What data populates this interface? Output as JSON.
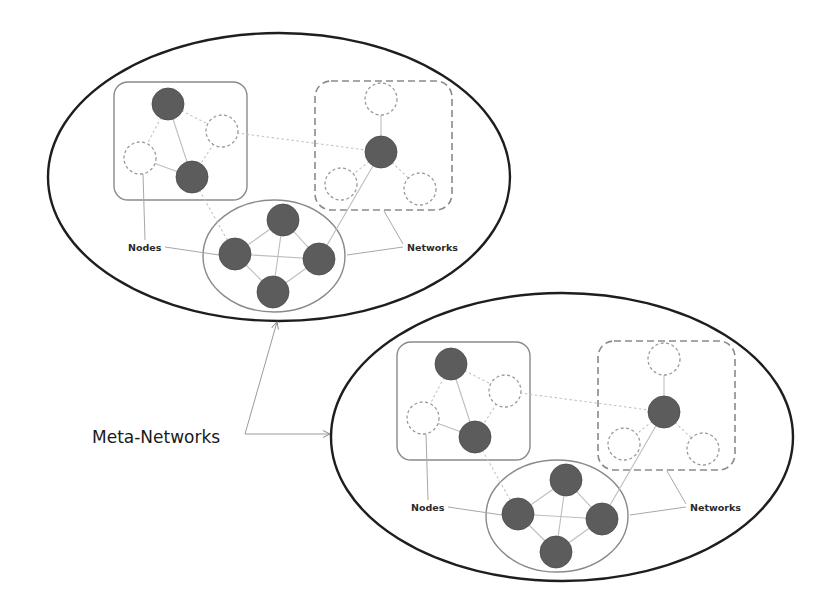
{
  "diagram": {
    "title_label": "Meta-Networks",
    "node_label": "Nodes",
    "network_label": "Networks",
    "colors": {
      "outer_stroke": "#1e1e1e",
      "filled_node": "#5c5c5c",
      "box_stroke": "#8a8a8a",
      "edge": "#bdbdbd"
    },
    "meta_networks": [
      {
        "id": "upper",
        "offset": [
          0,
          0
        ],
        "nodes_label": "Nodes",
        "networks_label": "Networks"
      },
      {
        "id": "lower",
        "offset": [
          283,
          260
        ],
        "nodes_label": "Nodes",
        "networks_label": "Networks"
      }
    ],
    "template": {
      "outer_ellipse": {
        "cx": 279,
        "cy": 177,
        "rx": 231,
        "ry": 144
      },
      "networks": [
        {
          "name": "left-solid-box",
          "shape": "rounded-rect",
          "style": "solid",
          "x": 114,
          "y": 82,
          "w": 133,
          "h": 118,
          "r": 14
        },
        {
          "name": "right-dashed-box",
          "shape": "rounded-rect",
          "style": "dashed",
          "x": 315,
          "y": 81,
          "w": 137,
          "h": 129,
          "r": 16
        },
        {
          "name": "bottom-ellipse",
          "shape": "ellipse",
          "style": "solid",
          "cx": 274,
          "cy": 256,
          "rx": 71,
          "ry": 56
        }
      ],
      "nodes": [
        {
          "id": "a1",
          "x": 168,
          "y": 104,
          "filled": true
        },
        {
          "id": "a2",
          "x": 222,
          "y": 131,
          "filled": false
        },
        {
          "id": "a3",
          "x": 140,
          "y": 158,
          "filled": false
        },
        {
          "id": "a4",
          "x": 192,
          "y": 177,
          "filled": true
        },
        {
          "id": "b1",
          "x": 381,
          "y": 99,
          "filled": false
        },
        {
          "id": "b2",
          "x": 381,
          "y": 152,
          "filled": true
        },
        {
          "id": "b3",
          "x": 341,
          "y": 184,
          "filled": false
        },
        {
          "id": "b4",
          "x": 420,
          "y": 189,
          "filled": false
        },
        {
          "id": "c1",
          "x": 283,
          "y": 220,
          "filled": true
        },
        {
          "id": "c2",
          "x": 235,
          "y": 254,
          "filled": true
        },
        {
          "id": "c3",
          "x": 319,
          "y": 259,
          "filled": true
        },
        {
          "id": "c4",
          "x": 273,
          "y": 292,
          "filled": true
        }
      ],
      "node_radius": 16,
      "edges": [
        {
          "from": "a1",
          "to": "a2",
          "style": "dotted"
        },
        {
          "from": "a1",
          "to": "a3",
          "style": "dotted"
        },
        {
          "from": "a1",
          "to": "a4",
          "style": "solid"
        },
        {
          "from": "a2",
          "to": "a4",
          "style": "dotted"
        },
        {
          "from": "a3",
          "to": "a4",
          "style": "solid"
        },
        {
          "from": "a2",
          "to": "b2",
          "style": "dotted"
        },
        {
          "from": "a4",
          "to": "c2",
          "style": "dotted"
        },
        {
          "from": "b1",
          "to": "b2",
          "style": "solid"
        },
        {
          "from": "b2",
          "to": "b3",
          "style": "dotted"
        },
        {
          "from": "b2",
          "to": "b4",
          "style": "dotted"
        },
        {
          "from": "b2",
          "to": "c3",
          "style": "solid"
        },
        {
          "from": "c1",
          "to": "c2",
          "style": "solid"
        },
        {
          "from": "c1",
          "to": "c3",
          "style": "solid"
        },
        {
          "from": "c1",
          "to": "c4",
          "style": "solid"
        },
        {
          "from": "c2",
          "to": "c3",
          "style": "solid"
        },
        {
          "from": "c2",
          "to": "c4",
          "style": "solid"
        },
        {
          "from": "c3",
          "to": "c4",
          "style": "solid"
        }
      ],
      "nodes_label_pos": {
        "x": 128,
        "y": 251
      },
      "nodes_leaders": [
        [
          [
            143,
            174
          ],
          [
            145,
            240
          ]
        ],
        [
          [
            165,
            247
          ],
          [
            219,
            255
          ]
        ]
      ],
      "networks_label_pos": {
        "x": 407,
        "y": 251
      },
      "networks_leaders": [
        [
          [
            403,
            244
          ],
          [
            384,
            211
          ]
        ],
        [
          [
            403,
            247
          ],
          [
            347,
            255
          ]
        ]
      ]
    },
    "meta_label": {
      "x": 92,
      "y": 443
    },
    "meta_arrows": [
      {
        "from": [
          245,
          434
        ],
        "to": [
          277,
          322
        ]
      },
      {
        "from": [
          245,
          434
        ],
        "to": [
          330,
          434
        ]
      }
    ]
  }
}
